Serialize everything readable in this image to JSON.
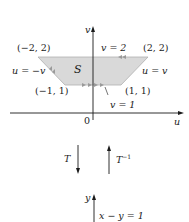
{
  "diagram": {
    "upper_plane": {
      "axes": {
        "vertical": "v",
        "horizontal": "u",
        "origin": "0"
      },
      "region": {
        "label": "S",
        "fill": "#d9d9d9",
        "vertices": [
          {
            "label": "(−2, 2)",
            "coords": [
              -2,
              2
            ]
          },
          {
            "label": "(2, 2)",
            "coords": [
              2,
              2
            ]
          },
          {
            "label": "(1, 1)",
            "coords": [
              1,
              1
            ]
          },
          {
            "label": "(−1, 1)",
            "coords": [
              -1,
              1
            ]
          }
        ],
        "boundary_labels": {
          "top": "v = 2",
          "bottom": "v = 1",
          "left": "u = −v",
          "right": "u = v"
        }
      }
    },
    "transform": {
      "forward": "T",
      "inverse": "T",
      "inverse_superscript": "−1"
    },
    "lower_plane": {
      "axes": {
        "vertical": "y"
      },
      "line_label": "x − y = 1"
    },
    "colors": {
      "axis": "#1a1a1a",
      "region_fill": "#d9d9d9",
      "region_arrows": "#999999"
    }
  }
}
